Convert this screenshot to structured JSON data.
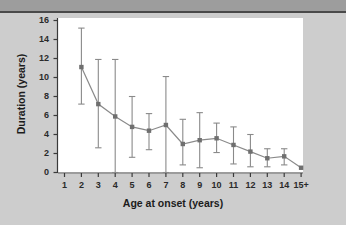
{
  "figure": {
    "background_color": "#cdcdcd",
    "plot_background_color": "#ffffff",
    "top_band_color": "#9d9d9d",
    "series_color": "#8a8a8a",
    "marker_color": "#6f6f6f",
    "text_color": "#1c1c1c"
  },
  "chart_data": {
    "type": "line",
    "title": "",
    "subtitle": "",
    "xlabel": "Age at onset (years)",
    "ylabel": "Duration (years)",
    "x": [
      1,
      2,
      3,
      4,
      5,
      6,
      7,
      8,
      9,
      10,
      11,
      12,
      13,
      14,
      15
    ],
    "categories": [
      "1",
      "2",
      "3",
      "4",
      "5",
      "6",
      "7",
      "8",
      "9",
      "10",
      "11",
      "12",
      "13",
      "14",
      "15+"
    ],
    "xtick_labels": [
      "1",
      "2",
      "3",
      "4",
      "5",
      "6",
      "7",
      "8",
      "9",
      "10",
      "11",
      "12",
      "13",
      "14",
      "15+"
    ],
    "ytick_labels": [
      "0",
      "2",
      "4",
      "6",
      "8",
      "10",
      "12",
      "14",
      "16"
    ],
    "ytick_values": [
      0,
      2,
      4,
      6,
      8,
      10,
      12,
      14,
      16
    ],
    "xlim": [
      0.4,
      15.6
    ],
    "ylim": [
      0,
      16
    ],
    "grid": false,
    "legend": null,
    "legend_position": "none",
    "marker": "square",
    "series": [
      {
        "name": "Mean duration",
        "values": [
          null,
          11.1,
          7.2,
          5.9,
          4.8,
          4.4,
          5.0,
          3.0,
          3.4,
          3.6,
          2.9,
          2.2,
          1.5,
          1.7,
          0.5
        ],
        "error_low": [
          null,
          7.2,
          2.6,
          0.0,
          1.6,
          2.4,
          0.0,
          0.8,
          0.5,
          2.1,
          0.9,
          0.6,
          0.6,
          0.8,
          null
        ],
        "error_high": [
          null,
          15.2,
          11.9,
          11.9,
          8.0,
          6.2,
          10.1,
          5.6,
          6.3,
          5.2,
          4.8,
          4.0,
          2.5,
          2.5,
          null
        ]
      }
    ],
    "annotations": []
  }
}
